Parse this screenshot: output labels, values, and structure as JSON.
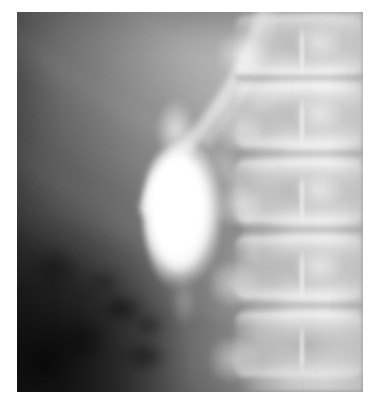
{
  "image": {
    "kind": "radiograph",
    "modality": "X-ray",
    "study": "Oral cholecystogram",
    "view": "Abdomen, anteroposterior",
    "alt_text": "Abdominal radiograph showing a bright, opacified, pear-shaped gallbladder in the right upper quadrant, adjacent to the lumbar spine.",
    "width_px": 378,
    "height_px": 404,
    "plate": {
      "left_px": 17,
      "top_px": 12,
      "width_px": 346,
      "height_px": 380
    },
    "background_color": "#ffffff",
    "palette": {
      "film_darkest": "#2b2b2b",
      "soft_tissue_mid": "#6a6a6a",
      "soft_tissue_light": "#a8a8a8",
      "bone_bright": "#e8e8e8",
      "contrast_white": "#ffffff"
    }
  },
  "anatomy": {
    "regions": [
      {
        "id": "gallbladder",
        "label": "Gallbladder (contrast-opacified)",
        "description": "Pear-shaped radiodense structure, brightest feature of the film",
        "center_pct": {
          "x": 47,
          "y": 54
        },
        "size_pct": {
          "w": 22,
          "h": 40
        }
      },
      {
        "id": "lumbar-spine",
        "label": "Lumbar vertebral column",
        "description": "Stacked vertebral bodies with intervening disc spaces along the right margin",
        "vertebra_count": 5
      },
      {
        "id": "ribs",
        "label": "Lower rib shadows",
        "description": "Oblique radiolucent-bordered bands crossing the upper-left field",
        "count": 4
      },
      {
        "id": "bowel-gas",
        "label": "Bowel gas pattern",
        "description": "Mottled lucencies in the lower-left abdomen"
      },
      {
        "id": "liver",
        "label": "Hepatic shadow",
        "description": "Broad homogeneous density occupying the upper abdomen"
      }
    ],
    "vertebrae": [
      {
        "id": "v1",
        "top_pct": 1,
        "height_pct": 15.5
      },
      {
        "id": "v2",
        "top_pct": 19,
        "height_pct": 16.5
      },
      {
        "id": "v3",
        "top_pct": 39,
        "height_pct": 16.5
      },
      {
        "id": "v4",
        "top_pct": 59,
        "height_pct": 16.5
      },
      {
        "id": "v5",
        "top_pct": 79,
        "height_pct": 17.0
      }
    ],
    "disc_spaces": [
      {
        "id": "d1",
        "top_pct": 16.0
      },
      {
        "id": "d2",
        "top_pct": 36.0
      },
      {
        "id": "d3",
        "top_pct": 56.0
      },
      {
        "id": "d4",
        "top_pct": 76.0
      }
    ],
    "bowel_gas_pockets": [
      {
        "id": "g1",
        "left_pct": 24,
        "top_pct": 74,
        "w_pct": 13,
        "h_pct": 8,
        "opacity": 0.5
      },
      {
        "id": "g2",
        "left_pct": 33,
        "top_pct": 79,
        "w_pct": 10,
        "h_pct": 7,
        "opacity": 0.42
      },
      {
        "id": "g3",
        "left_pct": 30,
        "top_pct": 86,
        "w_pct": 14,
        "h_pct": 9,
        "opacity": 0.46
      },
      {
        "id": "g4",
        "left_pct": 11,
        "top_pct": 80,
        "w_pct": 16,
        "h_pct": 12,
        "opacity": 0.38
      },
      {
        "id": "g5",
        "left_pct": 20,
        "top_pct": 68,
        "w_pct": 11,
        "h_pct": 6,
        "opacity": 0.3
      },
      {
        "id": "g6",
        "left_pct": 4,
        "top_pct": 62,
        "w_pct": 14,
        "h_pct": 10,
        "opacity": 0.3
      }
    ]
  }
}
